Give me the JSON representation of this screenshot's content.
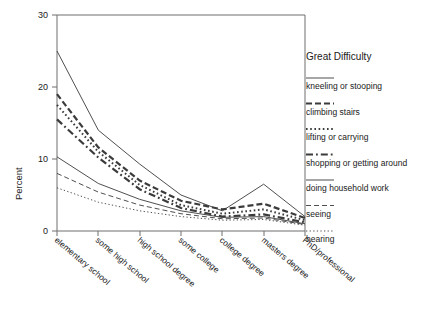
{
  "chart_data": {
    "type": "line",
    "title": "",
    "xlabel": "",
    "ylabel": "Percent",
    "ylim": [
      0,
      30
    ],
    "yticks": [
      0,
      10,
      20,
      30
    ],
    "grid": false,
    "legend_position": "right",
    "legend_title": "Great Difficulty",
    "categories": [
      "elementary school",
      "some high school",
      "high school degree",
      "some college",
      "college degree",
      "masters degree",
      "PhD/professional"
    ],
    "series": [
      {
        "name": "kneeling or stooping",
        "style": "solid-thin",
        "values": [
          25.0,
          14.0,
          9.3,
          5.0,
          2.8,
          6.5,
          2.0
        ]
      },
      {
        "name": "climbing stairs",
        "style": "dashed-thick",
        "values": [
          19.0,
          11.6,
          7.0,
          4.2,
          3.0,
          3.8,
          1.8
        ]
      },
      {
        "name": "lifting or carrying",
        "style": "dotted-thick",
        "values": [
          17.5,
          11.0,
          6.4,
          3.6,
          2.4,
          3.0,
          1.5
        ]
      },
      {
        "name": "shopping or getting around",
        "style": "dashdot-thick",
        "values": [
          15.5,
          10.2,
          5.8,
          3.2,
          2.0,
          2.3,
          1.2
        ]
      },
      {
        "name": "doing household work",
        "style": "solid-thin",
        "values": [
          10.3,
          6.6,
          4.4,
          2.8,
          1.9,
          2.0,
          1.0
        ]
      },
      {
        "name": "seeing",
        "style": "dashed-thin",
        "values": [
          8.0,
          5.4,
          3.6,
          2.4,
          1.7,
          1.8,
          0.9
        ]
      },
      {
        "name": "hearing",
        "style": "dotted-thin",
        "values": [
          6.0,
          4.0,
          2.8,
          2.0,
          1.5,
          1.6,
          0.8
        ]
      }
    ]
  },
  "legend": {
    "title": "Great Difficulty",
    "entries": [
      {
        "label": "kneeling or stooping"
      },
      {
        "label": "climbing stairs"
      },
      {
        "label": "lifting or carrying"
      },
      {
        "label": "shopping or getting around"
      },
      {
        "label": "doing household work"
      },
      {
        "label": "seeing"
      },
      {
        "label": "hearing"
      }
    ]
  },
  "axes": {
    "y_title": "Percent",
    "y_tick_labels": [
      "0",
      "10",
      "20",
      "30"
    ],
    "x_tick_labels": [
      "elementary school",
      "some high school",
      "high school degree",
      "some college",
      "college degree",
      "masters degree",
      "PhD/professional"
    ]
  },
  "colors": {
    "line": "#3b3b3b",
    "axis": "#6e6e6e",
    "text": "#1a1a1a",
    "background": "#ffffff"
  }
}
